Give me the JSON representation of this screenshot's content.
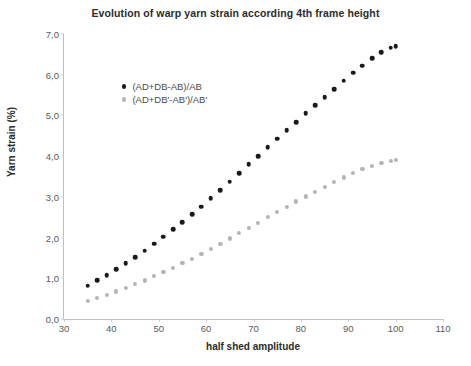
{
  "chart_data": {
    "type": "scatter",
    "title": "Evolution of warp yarn strain according 4th frame height",
    "xlabel": "half shed amplitude",
    "ylabel": "Yarn strain (%)",
    "xlim": [
      30,
      110
    ],
    "ylim": [
      0.0,
      7.0
    ],
    "xticks": [
      "30",
      "40",
      "50",
      "60",
      "70",
      "80",
      "90",
      "100",
      "110"
    ],
    "xtick_values": [
      30,
      40,
      50,
      60,
      70,
      80,
      90,
      100,
      110
    ],
    "yticks": [
      "0,0",
      "1,0",
      "2,0",
      "3,0",
      "4,0",
      "5,0",
      "6,0",
      "7,0"
    ],
    "ytick_values": [
      0,
      1,
      2,
      3,
      4,
      5,
      6,
      7
    ],
    "grid": false,
    "legend_position": "upper-left-inside",
    "series": [
      {
        "name": "(AD+DB-AB)/AB",
        "color": "#1a1a1a",
        "x": [
          35,
          37,
          39,
          41,
          43,
          45,
          47,
          49,
          51,
          53,
          55,
          57,
          59,
          61,
          63,
          65,
          67,
          69,
          71,
          73,
          75,
          77,
          79,
          81,
          83,
          85,
          87,
          89,
          91,
          93,
          95,
          97,
          99,
          100
        ],
        "y": [
          0.82,
          0.95,
          1.08,
          1.22,
          1.37,
          1.52,
          1.68,
          1.85,
          2.02,
          2.2,
          2.38,
          2.57,
          2.76,
          2.96,
          3.16,
          3.37,
          3.58,
          3.8,
          4.0,
          4.22,
          4.43,
          4.63,
          4.84,
          5.05,
          5.25,
          5.45,
          5.65,
          5.85,
          6.05,
          6.22,
          6.4,
          6.55,
          6.66,
          6.7
        ]
      },
      {
        "name": "(AD+DB'-AB')/AB'",
        "color": "#b4b4b4",
        "x": [
          35,
          37,
          39,
          41,
          43,
          45,
          47,
          49,
          51,
          53,
          55,
          57,
          59,
          61,
          63,
          65,
          67,
          69,
          71,
          73,
          75,
          77,
          79,
          81,
          83,
          85,
          87,
          89,
          91,
          93,
          95,
          97,
          99,
          100
        ],
        "y": [
          0.45,
          0.52,
          0.6,
          0.68,
          0.77,
          0.86,
          0.95,
          1.05,
          1.15,
          1.26,
          1.37,
          1.48,
          1.6,
          1.72,
          1.85,
          1.98,
          2.11,
          2.24,
          2.37,
          2.5,
          2.63,
          2.76,
          2.89,
          3.01,
          3.13,
          3.25,
          3.37,
          3.48,
          3.58,
          3.68,
          3.76,
          3.83,
          3.88,
          3.9
        ]
      }
    ]
  }
}
